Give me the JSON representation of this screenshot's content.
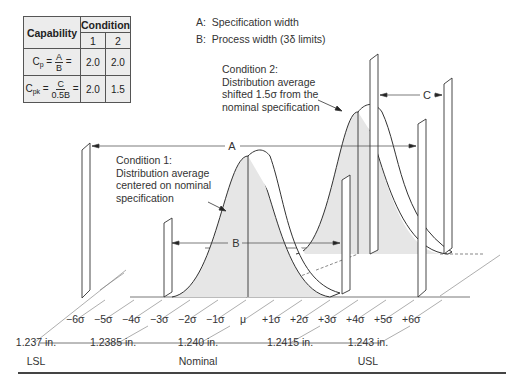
{
  "capability_table": {
    "header_label": "Capability",
    "condition_label": "Condition",
    "conditions": [
      "1",
      "2"
    ],
    "rows": [
      {
        "symbol": "C",
        "subscript": "p",
        "numerator": "A",
        "denominator": "B",
        "values": [
          "2.0",
          "2.0"
        ]
      },
      {
        "symbol": "C",
        "subscript": "pk",
        "numerator": "C",
        "denominator": "0.5B",
        "values": [
          "2.0",
          "1.5"
        ]
      }
    ]
  },
  "legend": {
    "items": [
      {
        "key": "A:",
        "text": "Specification width"
      },
      {
        "key": "B:",
        "text": "Process width (3δ limits)"
      }
    ]
  },
  "notes": {
    "condition1": [
      "Condition 1:",
      "Distribution average",
      "centered on nominal",
      "specification"
    ],
    "condition2": [
      "Condition 2:",
      "Distribution average",
      "shifted 1.5σ from the",
      "nominal specification"
    ]
  },
  "dimension_labels": {
    "A": "A",
    "B": "B",
    "C": "C"
  },
  "sigma_ticks": [
    "−6σ",
    "−5σ",
    "−4σ",
    "−3σ",
    "−2σ",
    "−1σ",
    "μ",
    "+1σ",
    "+2σ",
    "+3σ",
    "+4σ",
    "+5σ",
    "+6σ"
  ],
  "measurements": [
    {
      "value": "1.237 in.",
      "label": "LSL"
    },
    {
      "value": "1.2385 in.",
      "label": ""
    },
    {
      "value": "1.240 in.",
      "label": "Nominal"
    },
    {
      "value": "1.2415 in.",
      "label": ""
    },
    {
      "value": "1.243 in.",
      "label": "USL"
    }
  ],
  "colors": {
    "fill": "#e6e6e6",
    "stroke": "#333333"
  }
}
